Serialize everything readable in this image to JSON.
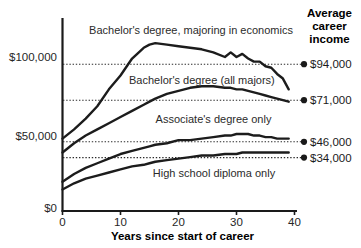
{
  "chart_data": {
    "type": "line",
    "title": "",
    "xlabel": "Years since start of career",
    "ylabel": "",
    "xlim": [
      0,
      40
    ],
    "ylim": [
      0,
      125000
    ],
    "grid": false,
    "gridlines_dotted_at": [
      94000,
      71000,
      46000,
      34000
    ],
    "x_ticks": [
      "0",
      "10",
      "20",
      "30",
      "40"
    ],
    "x_tick_values": [
      0,
      10,
      20,
      30,
      40
    ],
    "y_ticks": [
      "$0",
      "$50,000",
      "$100,000"
    ],
    "y_tick_values": [
      0,
      50000,
      100000
    ],
    "legend_position": "inline-labels",
    "x": [
      0,
      2,
      4,
      6,
      8,
      10,
      12,
      14,
      15,
      16,
      18,
      20,
      22,
      24,
      26,
      28,
      29,
      30,
      31,
      32,
      33,
      34,
      35,
      36,
      37,
      38,
      39
    ],
    "series": [
      {
        "name": "Bachelor's degree, majoring in economics",
        "label": "Bachelor's degree, majoring in economics",
        "average_career_income": "$94,000",
        "average_career_income_value": 94000,
        "values": [
          47000,
          53000,
          60000,
          68000,
          79000,
          88000,
          99000,
          106000,
          108000,
          109000,
          108000,
          107000,
          106000,
          105000,
          103000,
          100000,
          103000,
          100000,
          102000,
          99000,
          97000,
          97000,
          94000,
          93000,
          89000,
          86000,
          79000
        ]
      },
      {
        "name": "Bachelor's degree (all majors)",
        "label": "Bachelor's degree (all majors)",
        "average_career_income": "$71,000",
        "average_career_income_value": 71000,
        "values": [
          38000,
          44000,
          49000,
          53000,
          57000,
          61000,
          65000,
          69000,
          71000,
          73000,
          76000,
          78000,
          80000,
          81000,
          81000,
          80000,
          80000,
          79000,
          79000,
          78000,
          77000,
          76000,
          75000,
          74000,
          73000,
          72000,
          71000
        ]
      },
      {
        "name": "Associate's degree only",
        "label": "Associate's degree only",
        "average_career_income": "$46,000",
        "average_career_income_value": 46000,
        "values": [
          19000,
          24000,
          28000,
          31000,
          34000,
          37000,
          39000,
          41000,
          42000,
          43000,
          44000,
          46000,
          46000,
          47000,
          48000,
          49000,
          49000,
          50000,
          50000,
          50000,
          49000,
          49000,
          48000,
          48000,
          47000,
          47000,
          47000
        ]
      },
      {
        "name": "High school diploma only",
        "label": "High school diploma only",
        "average_career_income": "$34,000",
        "average_career_income_value": 34000,
        "values": [
          14000,
          18000,
          21000,
          23000,
          25000,
          27000,
          29000,
          30000,
          31000,
          32000,
          33000,
          34000,
          35000,
          36000,
          36000,
          37000,
          37000,
          37000,
          38000,
          38000,
          38000,
          38000,
          38000,
          38000,
          38000,
          38000,
          38000
        ]
      }
    ]
  },
  "right_panel": {
    "heading_line1": "Average",
    "heading_line2": "career",
    "heading_line3": "income",
    "values": [
      "$94,000",
      "$71,000",
      "$46,000",
      "$34,000"
    ]
  },
  "axis": {
    "x_title": "Years since start of career",
    "y_tick_0": "$0",
    "y_tick_50k": "$50,000",
    "y_tick_100k": "$100,000",
    "x_tick_0": "0",
    "x_tick_10": "10",
    "x_tick_20": "20",
    "x_tick_30": "30",
    "x_tick_40": "40"
  },
  "series_labels": {
    "econ": "Bachelor's degree, majoring in economics",
    "bachelor": "Bachelor's degree (all majors)",
    "associate": "Associate's degree only",
    "highschool": "High school diploma only"
  }
}
